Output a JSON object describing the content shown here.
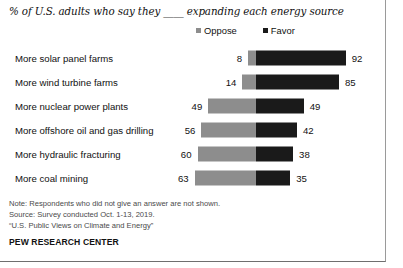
{
  "chart_data": {
    "type": "bar",
    "subtype": "diverging-stacked-bar",
    "title": "% of U.S. adults who say they ____ expanding each energy source",
    "xlabel": "",
    "ylabel": "",
    "grid": false,
    "legend_position": "top-right",
    "categories": [
      "More solar panel farms",
      "More wind turbine farms",
      "More nuclear power plants",
      "More offshore oil and gas drilling",
      "More hydraulic fracturing",
      "More coal mining"
    ],
    "series": [
      {
        "name": "Oppose",
        "color": "#8d8d8d",
        "values": [
          8,
          14,
          49,
          56,
          60,
          63
        ]
      },
      {
        "name": "Favor",
        "color": "#1a1a1a",
        "values": [
          92,
          85,
          49,
          42,
          38,
          35
        ]
      }
    ],
    "annotations": [
      "Note: Respondents who did not give an answer are not shown.",
      "Source: Survey conducted Oct. 1-13, 2019.",
      "“U.S. Public Views on Climate and Energy”"
    ],
    "source_brand": "PEW RESEARCH CENTER"
  },
  "legend": {
    "items": [
      {
        "label": "Oppose",
        "color": "#8d8d8d"
      },
      {
        "label": "Favor",
        "color": "#1a1a1a"
      }
    ]
  },
  "notes": {
    "line1": "Note: Respondents who did not give an answer are not shown.",
    "line2": "Source: Survey conducted Oct. 1-13, 2019.",
    "line3": "“U.S. Public Views on Climate and Energy”"
  },
  "brand": "PEW RESEARCH CENTER"
}
